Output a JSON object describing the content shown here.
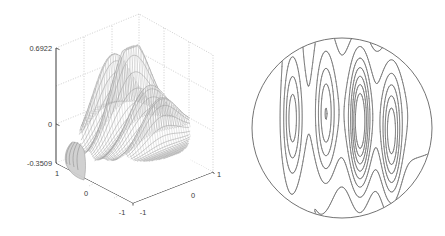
{
  "figure": {
    "title": "",
    "background_color": "#ffffff",
    "panels": [
      "surface-plot",
      "contour-plot"
    ]
  },
  "surface_plot": {
    "name": "3d-mesh-surface-plot",
    "axis_color": "#4d4d4d",
    "grid_color": "#b9b9b9",
    "mesh_color": "#7a7a7a",
    "z_axis": {
      "label": "",
      "ticks": [
        "0.6922",
        "0",
        "-0.3509"
      ],
      "tick_values": [
        0.6922,
        0,
        -0.3509
      ]
    },
    "x_axis": {
      "label": "",
      "ticks": [
        "1",
        "0",
        "-1"
      ],
      "tick_values": [
        1,
        0,
        -1
      ]
    },
    "y_axis": {
      "label": "",
      "ticks": [
        "-1",
        "0",
        "1"
      ],
      "tick_values": [
        -1,
        0,
        1
      ]
    }
  },
  "contour_plot": {
    "name": "circular-contour-plot",
    "line_color": "#5a5a5a",
    "boundary": "circle",
    "boundary_radius": 90,
    "center": [
      342,
      128
    ]
  },
  "chart_data": [
    {
      "type": "surface",
      "title": "",
      "xlabel": "",
      "ylabel": "",
      "zlabel": "",
      "xlim": [
        -1,
        1
      ],
      "ylim": [
        -1,
        1
      ],
      "zlim": [
        -0.3509,
        0.6922
      ],
      "xticks": [
        -1,
        0,
        1
      ],
      "yticks": [
        -1,
        0,
        1
      ],
      "zticks": [
        -0.3509,
        0,
        0.6922
      ],
      "xticklabels": [
        "-1",
        "0",
        "1"
      ],
      "yticklabels": [
        "-1",
        "0",
        "1"
      ],
      "zticklabels": [
        "-0.3509",
        "0",
        "0.6922"
      ],
      "grid": true,
      "legend": null,
      "z_min": -0.3509,
      "z_max": 0.6922,
      "domain": "unit disk",
      "description": "Mesh surface over the unit disk with several tall narrow ridge-like peaks rising to 0.6922 and shallow troughs down to -0.3509",
      "peaks": [
        {
          "x": -0.55,
          "y": 0.1,
          "z": 0.42
        },
        {
          "x": -0.18,
          "y": 0.15,
          "z": 0.39
        },
        {
          "x": 0.2,
          "y": 0.05,
          "z": 0.69
        },
        {
          "x": 0.55,
          "y": -0.1,
          "z": 0.52
        }
      ]
    },
    {
      "type": "contour",
      "title": "",
      "xlabel": "",
      "ylabel": "",
      "xlim": [
        -1,
        1
      ],
      "ylim": [
        -1,
        1
      ],
      "grid": false,
      "legend": null,
      "domain": "unit disk",
      "n_levels": 10,
      "levels": [
        -0.3,
        -0.2,
        -0.1,
        0.0,
        0.1,
        0.2,
        0.3,
        0.4,
        0.5,
        0.6
      ],
      "description": "Contour map of the same function on the unit disk: three clusters of tightly nested elongated closed loops (finger-like ridges) around the peaks, with broad sparse contours elsewhere"
    }
  ]
}
